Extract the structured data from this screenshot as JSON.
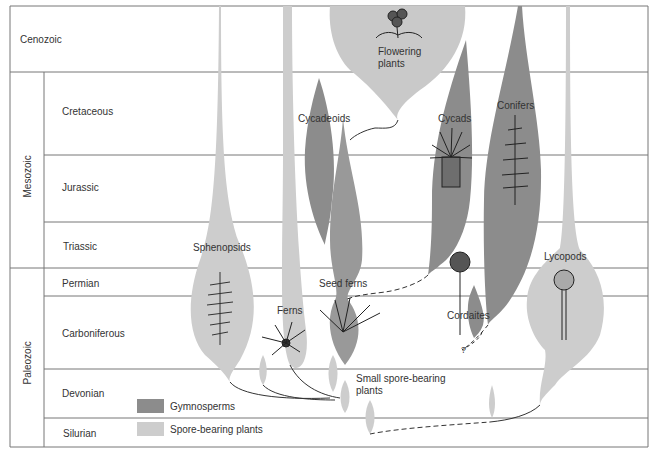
{
  "eras": [
    {
      "name": "Cenozoic"
    },
    {
      "name": "Mesozoic"
    },
    {
      "name": "Paleozoic"
    }
  ],
  "periods": [
    {
      "name": "Cretaceous"
    },
    {
      "name": "Jurassic"
    },
    {
      "name": "Triassic"
    },
    {
      "name": "Permian"
    },
    {
      "name": "Carboniferous"
    },
    {
      "name": "Devonian"
    },
    {
      "name": "Silurian"
    }
  ],
  "groups": [
    {
      "name": "Flowering plants",
      "line1": "Flowering",
      "line2": "plants",
      "type": "angiosperm"
    },
    {
      "name": "Cycadeoids",
      "type": "gymnosperm"
    },
    {
      "name": "Cycads",
      "type": "gymnosperm"
    },
    {
      "name": "Conifers",
      "type": "gymnosperm"
    },
    {
      "name": "Sphenopsids",
      "type": "spore-bearing"
    },
    {
      "name": "Seed ferns",
      "type": "gymnosperm"
    },
    {
      "name": "Ferns",
      "type": "spore-bearing"
    },
    {
      "name": "Cordaites",
      "type": "gymnosperm"
    },
    {
      "name": "Lycopods",
      "type": "spore-bearing"
    },
    {
      "name": "Small spore-bearing plants",
      "line1": "Small spore-bearing",
      "line2": "plants",
      "type": "spore-bearing"
    }
  ],
  "uncertain_marker": "?",
  "legend": [
    {
      "label": "Gymnosperms",
      "color": "#8c8c8c"
    },
    {
      "label": "Spore-bearing plants",
      "color": "#cdcdcd"
    }
  ],
  "colors": {
    "gymnosperm": "#8c8c8c",
    "spore": "#cdcdcd",
    "grid": "#777777"
  }
}
